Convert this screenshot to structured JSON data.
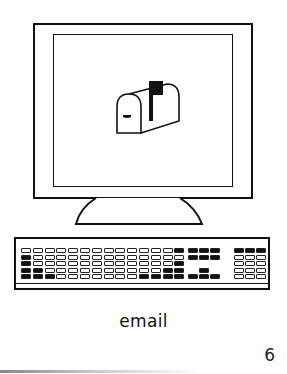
{
  "illustration": {
    "subject": "computer-with-mailbox",
    "screen_icon": "mailbox-icon",
    "colors": {
      "ink": "#111111",
      "paper": "#ffffff"
    },
    "keyboard": {
      "main_keys": [
        [
          0,
          0,
          0,
          0,
          0,
          0,
          0,
          0,
          0,
          0,
          0,
          0,
          0,
          1
        ],
        [
          1,
          0,
          0,
          0,
          0,
          0,
          0,
          0,
          0,
          0,
          0,
          0,
          0,
          0
        ],
        [
          1,
          0,
          0,
          0,
          0,
          0,
          0,
          0,
          0,
          0,
          0,
          0,
          0,
          1
        ],
        [
          1,
          1,
          0,
          0,
          0,
          0,
          0,
          0,
          0,
          0,
          0,
          0,
          1,
          1
        ],
        [
          1,
          1,
          1,
          0,
          0,
          0,
          0,
          0,
          0,
          0,
          1,
          1,
          1,
          1
        ]
      ],
      "nav_keys": [
        [
          1,
          1,
          1
        ],
        [
          1,
          1,
          1
        ],
        [
          2,
          2,
          2
        ],
        [
          2,
          1,
          2
        ],
        [
          1,
          1,
          1
        ]
      ],
      "num_keys": [
        [
          1,
          1,
          1
        ],
        [
          0,
          0,
          0
        ],
        [
          0,
          0,
          0
        ],
        [
          0,
          0,
          0
        ],
        [
          0,
          0,
          0
        ]
      ]
    }
  },
  "caption": "email",
  "page_number": "6"
}
